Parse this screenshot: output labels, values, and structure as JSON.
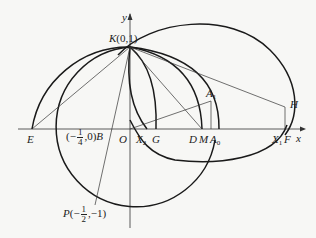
{
  "figure": {
    "axes": {
      "x_label": "x",
      "y_label": "y"
    },
    "points": {
      "K": {
        "name": "K",
        "coord": "(0,1)"
      },
      "O": {
        "name": "O"
      },
      "E": {
        "name": "E"
      },
      "B": {
        "name": "B",
        "coord_prefix": "(−",
        "coord_num": "1",
        "coord_den": "4",
        "coord_suffix": ",0)"
      },
      "X2": {
        "name": "X",
        "sub": "2"
      },
      "G": {
        "name": "G"
      },
      "D": {
        "name": "D"
      },
      "M": {
        "name": "M"
      },
      "A0": {
        "name": "A",
        "sub": "0"
      },
      "A1": {
        "name": "A",
        "sub": "1"
      },
      "X1": {
        "name": "X",
        "sub": "1"
      },
      "F": {
        "name": "F"
      },
      "H": {
        "name": "H"
      },
      "P": {
        "name": "P",
        "coord_prefix": "(−",
        "coord_num": "1",
        "coord_den": "2",
        "coord_suffix": ",−1)"
      }
    },
    "colors": {
      "stroke": "#1a1a1a",
      "thin_stroke": "#333333",
      "background": "#f7f7f5"
    }
  }
}
